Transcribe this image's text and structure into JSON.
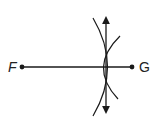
{
  "diagram": {
    "points": {
      "F": {
        "label": "F",
        "x": 22,
        "y": 67
      },
      "G": {
        "label": "G",
        "x": 132,
        "y": 67
      }
    },
    "segment": {
      "from": "F",
      "to": "G"
    },
    "bisector": {
      "x": 106,
      "y_top": 12,
      "y_bottom": 117,
      "arrows": "both"
    },
    "arcs": [
      {
        "name": "arc-centered-F",
        "note": "arc bulging right through intersections"
      },
      {
        "name": "arc-centered-G",
        "note": "arc bulging left through intersections"
      }
    ],
    "colors": {
      "stroke": "#1a1a1a",
      "background": "#ffffff"
    }
  }
}
